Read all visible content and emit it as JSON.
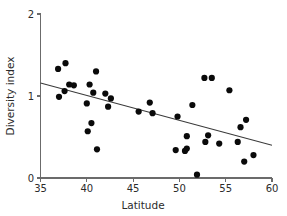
{
  "chart_data": {
    "type": "scatter",
    "title": "",
    "xlabel": "Latitude",
    "ylabel": "Diversity index",
    "xlim": [
      35,
      60
    ],
    "ylim": [
      0,
      2
    ],
    "xticks": [
      35,
      40,
      45,
      50,
      55,
      60
    ],
    "yticks": [
      0,
      1,
      2
    ],
    "xtick_labels": [
      "35",
      "40",
      "45",
      "50",
      "55",
      "60"
    ],
    "ytick_labels": [
      "0",
      "1",
      "2"
    ],
    "grid": false,
    "legend": null,
    "marker": "filled-circle",
    "marker_color": "#0a0a0a",
    "marker_size_px": 3.1,
    "points": [
      {
        "x": 36.9,
        "y": 1.33
      },
      {
        "x": 37.0,
        "y": 0.99
      },
      {
        "x": 37.6,
        "y": 1.06
      },
      {
        "x": 37.7,
        "y": 1.4
      },
      {
        "x": 38.1,
        "y": 1.14
      },
      {
        "x": 38.6,
        "y": 1.13
      },
      {
        "x": 40.0,
        "y": 0.91
      },
      {
        "x": 40.1,
        "y": 0.57
      },
      {
        "x": 40.3,
        "y": 1.14
      },
      {
        "x": 40.5,
        "y": 0.67
      },
      {
        "x": 40.7,
        "y": 1.04
      },
      {
        "x": 41.0,
        "y": 1.3
      },
      {
        "x": 41.1,
        "y": 0.35
      },
      {
        "x": 42.0,
        "y": 1.03
      },
      {
        "x": 42.3,
        "y": 0.87
      },
      {
        "x": 42.6,
        "y": 0.97
      },
      {
        "x": 45.6,
        "y": 0.81
      },
      {
        "x": 46.8,
        "y": 0.92
      },
      {
        "x": 47.1,
        "y": 0.79
      },
      {
        "x": 49.6,
        "y": 0.34
      },
      {
        "x": 49.8,
        "y": 0.75
      },
      {
        "x": 50.6,
        "y": 0.33
      },
      {
        "x": 50.8,
        "y": 0.36
      },
      {
        "x": 50.8,
        "y": 0.51
      },
      {
        "x": 51.4,
        "y": 0.89
      },
      {
        "x": 51.9,
        "y": 0.04
      },
      {
        "x": 52.7,
        "y": 1.22
      },
      {
        "x": 52.8,
        "y": 0.44
      },
      {
        "x": 53.1,
        "y": 0.52
      },
      {
        "x": 53.5,
        "y": 1.22
      },
      {
        "x": 54.3,
        "y": 0.42
      },
      {
        "x": 55.4,
        "y": 1.07
      },
      {
        "x": 56.3,
        "y": 0.44
      },
      {
        "x": 56.6,
        "y": 0.62
      },
      {
        "x": 57.0,
        "y": 0.2
      },
      {
        "x": 57.2,
        "y": 0.71
      },
      {
        "x": 58.0,
        "y": 0.28
      }
    ],
    "trendline": {
      "type": "linear-fit",
      "x_start": 35.0,
      "y_start": 1.16,
      "x_end": 60.0,
      "y_end": 0.4,
      "color": "#3a3a3a"
    }
  }
}
